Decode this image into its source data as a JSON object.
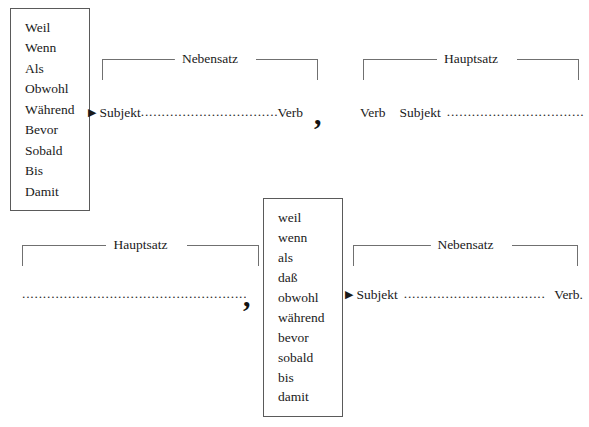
{
  "diagram": {
    "line_color": "#707070",
    "box_border_color": "#5a5a5a",
    "text_color": "#1a1a1a",
    "background": "#ffffff"
  },
  "conjunction_box_upper": {
    "name": "capitalized subordinating conjunctions",
    "items": [
      "Weil",
      "Wenn",
      "Als",
      "Obwohl",
      "Während",
      "Bevor",
      "Sobald",
      "Bis",
      "Damit"
    ]
  },
  "conjunction_box_lower": {
    "name": "lowercase subordinating conjunctions",
    "items": [
      "weil",
      "wenn",
      "als",
      "daß",
      "obwohl",
      "während",
      "bevor",
      "sobald",
      "bis",
      "damit"
    ]
  },
  "brackets": {
    "nebensatz_top": "Nebensatz",
    "hauptsatz_top": "Hauptsatz",
    "hauptsatz_bottom": "Hauptsatz",
    "nebensatz_bottom": "Nebensatz"
  },
  "clauses": {
    "nebensatz_top": {
      "marker": "▶",
      "first": "Subjekt",
      "dots": "........................................",
      "last": "Verb"
    },
    "hauptsatz_top": {
      "first": "Verb",
      "second": "Subjekt",
      "dots": "................................."
    },
    "hauptsatz_bottom": {
      "dots": "........................................................."
    },
    "nebensatz_bottom": {
      "marker": "▶",
      "first": "Subjekt",
      "dots": "..................................",
      "last": "Verb."
    }
  },
  "punctuation": {
    "comma_top": ",",
    "comma_bottom": ","
  }
}
